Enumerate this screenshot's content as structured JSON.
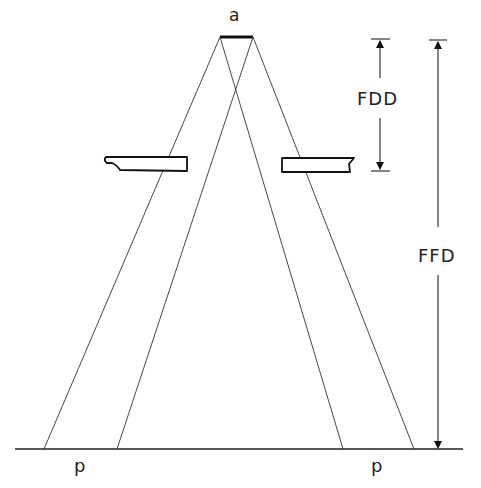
{
  "diagram": {
    "type": "x-ray geometry (focal spot, collimator, film)",
    "labels": {
      "focal_spot": "a",
      "fdd": "FDD",
      "ffd": "FFD",
      "penumbra_left": "p",
      "penumbra_right": "p"
    },
    "colors": {
      "line": "#222222",
      "background": "#ffffff"
    }
  }
}
